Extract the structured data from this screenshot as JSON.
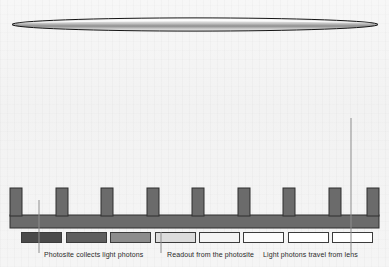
{
  "diagram": {
    "background_color": "#f4f4f4",
    "lens": {
      "name": "camera-lens",
      "shape": "flat-ellipse",
      "cx": 195,
      "cy": 24.5,
      "rx": 183,
      "ry": 6.5,
      "stroke_color": "#1a1a1a",
      "fill_top_color": "#ffffff",
      "fill_mid_color": "#9a9a9a",
      "fill_bottom_color": "#e8e8e8"
    },
    "sensor": {
      "name": "photosite-array",
      "tooth_color": "#6b6b6b",
      "tooth_stroke": "#2e2e2e",
      "well_color": "#f2f2f2",
      "tooth_count": 9,
      "well_count": 8,
      "top_y": 188,
      "base_top_y": 215,
      "base_bottom_y": 228,
      "left_x": 10,
      "right_x": 379
    },
    "bars": [
      {
        "id": 1,
        "label": "photosite-charge-bar-1",
        "x": 21,
        "width": 41,
        "fill": "#4a4a4a"
      },
      {
        "id": 2,
        "label": "photosite-charge-bar-2",
        "x": 66,
        "width": 41,
        "fill": "#5e5e5e"
      },
      {
        "id": 3,
        "label": "photosite-charge-bar-3",
        "x": 110,
        "width": 41,
        "fill": "#8c8c8c"
      },
      {
        "id": 4,
        "label": "photosite-charge-bar-4",
        "x": 155,
        "width": 41,
        "fill": "#dcdcdc"
      },
      {
        "id": 5,
        "label": "photosite-charge-bar-5",
        "x": 199,
        "width": 41,
        "fill": "#f4f4f4"
      },
      {
        "id": 6,
        "label": "photosite-charge-bar-6",
        "x": 243,
        "width": 41,
        "fill": "#fbfbfb"
      },
      {
        "id": 7,
        "label": "photosite-charge-bar-7",
        "x": 288,
        "width": 41,
        "fill": "#ffffff"
      },
      {
        "id": 8,
        "label": "photosite-charge-bar-8",
        "x": 332,
        "width": 41,
        "fill": "#ffffff"
      }
    ],
    "leaders": [
      {
        "name": "leader-photosite",
        "x": 39,
        "y1": 200,
        "y2": 253,
        "color": "#8e8e8e"
      },
      {
        "name": "leader-readout",
        "x": 161,
        "y1": 232,
        "y2": 253,
        "color": "#8e8e8e"
      },
      {
        "name": "leader-light-path",
        "x": 351,
        "y1": 118,
        "y2": 253,
        "color": "#8e8e8e"
      }
    ],
    "legend": [
      {
        "name": "legend-photosite-collects",
        "text": "Photosite collects light photons",
        "x": 44,
        "y": 4
      },
      {
        "name": "legend-readout",
        "text": "Readout from the photosite",
        "x": 167,
        "y": 4
      },
      {
        "name": "legend-light-travel",
        "text": "Light photons travel from lens",
        "x": 263,
        "y": 4
      }
    ]
  }
}
